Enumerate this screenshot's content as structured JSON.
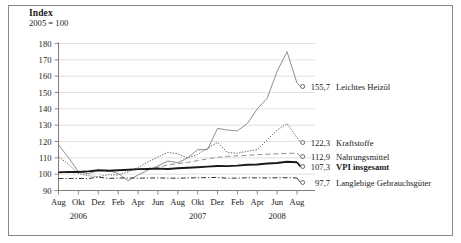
{
  "header": {
    "title": "Index",
    "subtitle": "2005 = 100"
  },
  "chart_data": {
    "type": "line",
    "title": "Index",
    "subtitle": "2005 = 100",
    "xlabel": "",
    "ylabel": "Index",
    "ylim": [
      90,
      180
    ],
    "ytick_step": 10,
    "yticks": [
      "90",
      "100",
      "110",
      "120",
      "130",
      "140",
      "150",
      "160",
      "170",
      "180"
    ],
    "grid": "horizontal",
    "legend_position": "right-inline-end-labels",
    "x": [
      "Aug 2006",
      "Sep 2006",
      "Okt 2006",
      "Nov 2006",
      "Dez 2006",
      "Jan 2007",
      "Feb 2007",
      "Mar 2007",
      "Apr 2007",
      "Mai 2007",
      "Jun 2007",
      "Jul 2007",
      "Aug 2007",
      "Sep 2007",
      "Okt 2007",
      "Nov 2007",
      "Dez 2007",
      "Jan 2008",
      "Feb 2008",
      "Mar 2008",
      "Apr 2008",
      "Mai 2008",
      "Jun 2008",
      "Jul 2008",
      "Aug 2008"
    ],
    "xtick_labels": [
      "Aug",
      "Okt",
      "Dez",
      "Feb",
      "Apr",
      "Jun",
      "Aug",
      "Okt",
      "Dez",
      "Feb",
      "Apr",
      "Jun",
      "Aug"
    ],
    "year_labels": [
      "2006",
      "2007",
      "2008"
    ],
    "series": [
      {
        "name": "Leichtes Heizöl",
        "end_value": "155,7",
        "style": "solid-thin",
        "bold_label": false,
        "values": [
          118.0,
          110.2,
          101.5,
          100.2,
          102.3,
          102.4,
          100.4,
          96.0,
          99.5,
          102.5,
          105.0,
          108.0,
          107.0,
          110.0,
          115.0,
          115.0,
          128.0,
          127.0,
          126.5,
          131.0,
          140.0,
          146.5,
          163.0,
          175.0,
          155.7
        ]
      },
      {
        "name": "Kraftstoffe",
        "end_value": "122,3",
        "style": "dotted",
        "bold_label": false,
        "values": [
          110.8,
          106.0,
          100.5,
          99.0,
          98.5,
          99.6,
          99.5,
          101.4,
          104.0,
          107.5,
          110.5,
          113.3,
          112.5,
          110.0,
          112.0,
          116.0,
          119.5,
          113.2,
          112.8,
          114.0,
          115.0,
          121.0,
          127.0,
          131.0,
          122.3
        ]
      },
      {
        "name": "Nahrungsmittel",
        "end_value": "112,9",
        "style": "dashed",
        "bold_label": false,
        "values": [
          101.2,
          101.5,
          101.8,
          101.9,
          102.2,
          102.0,
          102.3,
          102.6,
          102.9,
          103.5,
          104.2,
          105.6,
          106.5,
          107.2,
          108.3,
          109.4,
          110.3,
          110.9,
          111.2,
          111.5,
          111.9,
          112.2,
          112.5,
          112.7,
          112.9
        ]
      },
      {
        "name": "VPI insgesamt",
        "end_value": "107,3",
        "style": "solid-thick",
        "bold_label": true,
        "values": [
          101.1,
          101.4,
          101.3,
          101.7,
          102.4,
          102.1,
          102.4,
          102.7,
          103.1,
          103.2,
          103.4,
          103.2,
          103.6,
          103.9,
          104.2,
          104.6,
          105.0,
          104.9,
          105.2,
          105.8,
          105.9,
          106.5,
          106.8,
          107.6,
          107.3
        ]
      },
      {
        "name": "Langlebige Gebrauchsgüter",
        "end_value": "97,7",
        "style": "dash-dot",
        "bold_label": false,
        "values": [
          97.3,
          97.4,
          97.4,
          97.3,
          98.2,
          97.4,
          97.6,
          97.7,
          97.6,
          97.6,
          97.7,
          97.6,
          97.5,
          97.7,
          97.8,
          97.9,
          98.0,
          97.5,
          97.6,
          97.8,
          97.7,
          97.7,
          97.8,
          97.8,
          97.7
        ]
      }
    ]
  }
}
